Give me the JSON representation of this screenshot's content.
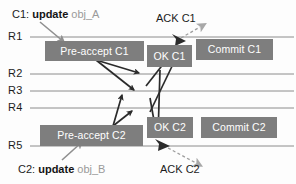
{
  "diagram": {
    "canvas": {
      "width": 296,
      "height": 184
    },
    "colors": {
      "box_fill": "#7e7e7e",
      "box_text": "#ffffff",
      "timeline": "#8c8c8c",
      "arrow_solid": "#2b2b2b",
      "arrow_dashed": "#9e9e9e",
      "ack_arrowhead": "#a8a8a8",
      "client_arrow": "#9e9e9e",
      "obj_text": "#9a9a9a",
      "label_text": "#1c1c1c"
    },
    "replicas": [
      {
        "id": "R1",
        "label": "R1",
        "y": 37
      },
      {
        "id": "R2",
        "label": "R2",
        "y": 74
      },
      {
        "id": "R3",
        "label": "R3",
        "y": 91
      },
      {
        "id": "R4",
        "label": "R4",
        "y": 108
      },
      {
        "id": "R5",
        "label": "R5",
        "y": 146
      }
    ],
    "messages": [
      {
        "id": "pre-accept-c1",
        "label": "Pre-accept C1",
        "x": 45,
        "y": 41,
        "w": 99,
        "h": 20,
        "replica": "R1",
        "command": "C1"
      },
      {
        "id": "ok-c1",
        "label": "OK C1",
        "x": 147,
        "y": 45,
        "w": 45,
        "h": 22,
        "replica": "R1",
        "command": "C1"
      },
      {
        "id": "commit-c1",
        "label": "Commit C1",
        "x": 196,
        "y": 39,
        "w": 77,
        "h": 21,
        "replica": "R1",
        "command": "C1"
      },
      {
        "id": "pre-accept-c2",
        "label": "Pre-accept C2",
        "x": 40,
        "y": 125,
        "w": 103,
        "h": 21,
        "replica": "R5",
        "command": "C2"
      },
      {
        "id": "ok-c2",
        "label": "OK C2",
        "x": 147,
        "y": 117,
        "w": 46,
        "h": 21,
        "replica": "R5",
        "command": "C2"
      },
      {
        "id": "commit-c2",
        "label": "Commit C2",
        "x": 201,
        "y": 117,
        "w": 76,
        "h": 21,
        "replica": "R5",
        "command": "C2"
      }
    ],
    "annotations": {
      "c1_request": {
        "prefix": "C1:",
        "verb": "update",
        "object": "obj_A",
        "x": 12,
        "y": 8
      },
      "c2_request": {
        "prefix": "C2:",
        "verb": "update",
        "object": "obj_B",
        "x": 18,
        "y": 163
      },
      "ack_c1": {
        "label": "ACK C1",
        "x": 156,
        "y": 12
      },
      "ack_c2": {
        "label": "ACK C2",
        "x": 160,
        "y": 163
      }
    },
    "legend_note": ""
  }
}
